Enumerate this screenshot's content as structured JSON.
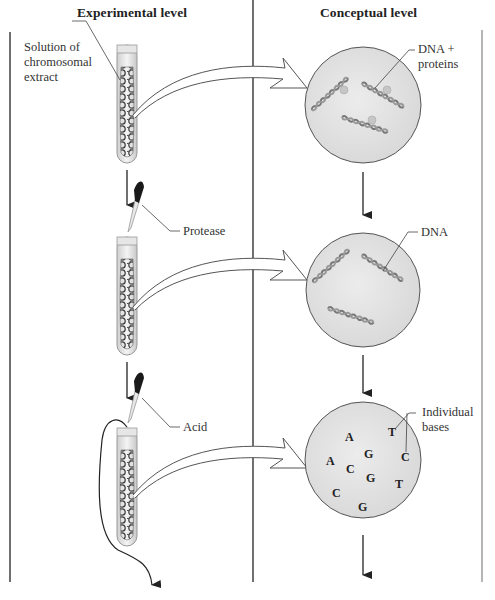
{
  "columns": {
    "left_header": "Experimental level",
    "right_header": "Conceptual level"
  },
  "steps": [
    {
      "experimental_label": "Solution of chromosomal extract",
      "experimental_label_lines": [
        "Solution of",
        "chromosomal",
        "extract"
      ],
      "conceptual_label_lines": [
        "DNA +",
        "proteins"
      ],
      "conceptual_content": "DNA strands with bound proteins"
    },
    {
      "reagent_label": "Protease",
      "conceptual_label_lines": [
        "DNA"
      ],
      "conceptual_content": "Naked DNA strands"
    },
    {
      "reagent_label": "Acid",
      "conceptual_label_lines": [
        "Individual",
        "bases"
      ],
      "conceptual_content": "Free nucleotide bases",
      "bases": [
        {
          "letter": "A",
          "x": 345,
          "y": 441
        },
        {
          "letter": "T",
          "x": 390,
          "y": 436
        },
        {
          "letter": "G",
          "x": 366,
          "y": 458
        },
        {
          "letter": "C",
          "x": 404,
          "y": 461
        },
        {
          "letter": "A",
          "x": 329,
          "y": 465
        },
        {
          "letter": "C",
          "x": 348,
          "y": 473
        },
        {
          "letter": "G",
          "x": 369,
          "y": 482
        },
        {
          "letter": "T",
          "x": 397,
          "y": 488
        },
        {
          "letter": "C",
          "x": 335,
          "y": 497
        },
        {
          "letter": "G",
          "x": 361,
          "y": 511
        }
      ]
    }
  ],
  "colors": {
    "line": "#222222",
    "circle_fill": "#e3e3e3",
    "circle_stroke": "#555555",
    "right_border": "#b5b5b5",
    "pipette_bulb": "#1a1a1a",
    "dna_fill": "#b0b0b0"
  }
}
